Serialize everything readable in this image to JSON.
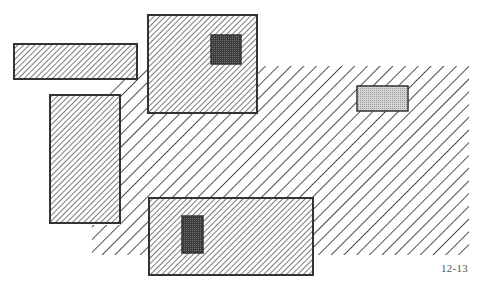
{
  "figure": {
    "label": "12-13",
    "colors": {
      "background": "#ffffff",
      "outline": "#333333",
      "hatch": "#222222",
      "dark_fill": "#4a4a4a",
      "light_fill": "#c8c8c8"
    },
    "regions": [
      {
        "name": "wide-hatched-region",
        "pattern": "wide-diagonal",
        "points": "92,255 92,225 120,225 120,95 100,95 140,66 469,66 469,255"
      },
      {
        "name": "top-left-bar",
        "pattern": "fine-diagonal",
        "x": 14,
        "y": 44,
        "w": 123,
        "h": 35
      },
      {
        "name": "left-tall-box",
        "pattern": "fine-diagonal",
        "x": 50,
        "y": 95,
        "w": 70,
        "h": 128
      },
      {
        "name": "top-box",
        "pattern": "fine-diagonal",
        "x": 148,
        "y": 15,
        "w": 109,
        "h": 98
      },
      {
        "name": "top-box-dark-square",
        "pattern": "dark",
        "x": 211,
        "y": 35,
        "w": 30,
        "h": 29
      },
      {
        "name": "bottom-box",
        "pattern": "fine-diagonal",
        "x": 149,
        "y": 198,
        "w": 164,
        "h": 77
      },
      {
        "name": "bottom-box-dark-rect",
        "pattern": "dark",
        "x": 182,
        "y": 216,
        "w": 21,
        "h": 37
      },
      {
        "name": "light-box",
        "pattern": "light",
        "x": 357,
        "y": 86,
        "w": 51,
        "h": 25
      }
    ]
  }
}
